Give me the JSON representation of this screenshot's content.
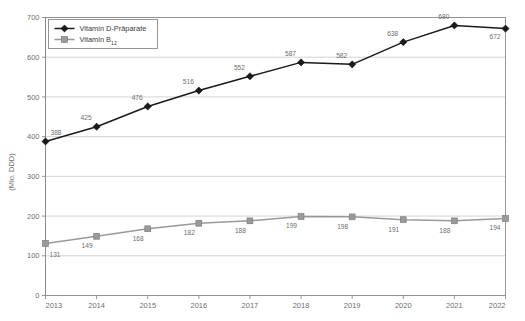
{
  "chart_data": {
    "type": "line",
    "title": "",
    "subtitle": "",
    "xlabel": "",
    "ylabel": "(Mio. DDD)",
    "categories": [
      "2013",
      "2014",
      "2015",
      "2016",
      "2017",
      "2018",
      "2019",
      "2020",
      "2021",
      "2022"
    ],
    "series": [
      {
        "name": "Vitamin D-Präparate",
        "name_base": "Vitamin D-Präparate",
        "name_sub": "",
        "color": "#1a1a1a",
        "marker": "diamond",
        "values": [
          388,
          425,
          476,
          516,
          552,
          587,
          582,
          638,
          680,
          672
        ]
      },
      {
        "name": "Vitamin B12",
        "name_base": "Vitamin B",
        "name_sub": "12",
        "color": "#9a9a9a",
        "marker": "square",
        "values": [
          131,
          149,
          168,
          182,
          188,
          199,
          198,
          191,
          188,
          194
        ]
      }
    ],
    "ylim": [
      0,
      700
    ],
    "yticks": [
      0,
      100,
      200,
      300,
      400,
      500,
      600,
      700
    ],
    "ytick_labels": [
      "0",
      "100",
      "200",
      "300",
      "400",
      "500",
      "600",
      "700"
    ],
    "grid": true,
    "grid_color": "#c9c9c9",
    "legend_position": "top-left",
    "plot_border_color": "#8a8a8a",
    "background": "#ffffff"
  },
  "axis": {
    "y_title": "(Mio. DDD)"
  }
}
